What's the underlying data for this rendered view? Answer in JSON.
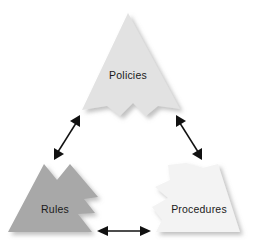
{
  "diagram": {
    "background_color": "#ffffff",
    "shape_style": "interlocking puzzle-piece triangles",
    "pieces": [
      {
        "id": "policies",
        "label": "Policies",
        "fill": "#e2e2e2",
        "position": "top",
        "label_x": 128,
        "label_y": 76
      },
      {
        "id": "rules",
        "label": "Rules",
        "fill": "#a8a8a8",
        "position": "bottom-left",
        "label_x": 55,
        "label_y": 210
      },
      {
        "id": "procedures",
        "label": "Procedures",
        "fill": "#f3f3f3",
        "position": "bottom-right",
        "label_x": 199,
        "label_y": 210
      }
    ],
    "connectors": [
      {
        "id": "rules-policies",
        "label": "",
        "from": "rules",
        "to": "policies",
        "heads": "both",
        "color": "#111111"
      },
      {
        "id": "policies-procedures",
        "label": "",
        "from": "policies",
        "to": "procedures",
        "heads": "both",
        "color": "#111111"
      },
      {
        "id": "rules-procedures",
        "label": "",
        "from": "rules",
        "to": "procedures",
        "heads": "both",
        "color": "#111111"
      }
    ]
  }
}
